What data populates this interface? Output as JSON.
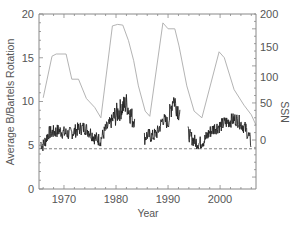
{
  "chart_data": {
    "type": "line",
    "title": "",
    "xlabel": "Year",
    "ylabel": "Average B/Bartels Rotation",
    "y2label": "SSN",
    "xlim": [
      1965.2,
      2006.9
    ],
    "ylim": [
      0,
      20
    ],
    "y2lim": [
      -50,
      200
    ],
    "x_ticks": [
      1970,
      1980,
      1990,
      2000
    ],
    "y_ticks": [
      0,
      5,
      10,
      15,
      20
    ],
    "y2_ticks": [
      0,
      50,
      100,
      150,
      200
    ],
    "grid": false,
    "legend": null,
    "reference_line": {
      "axis": "left",
      "value": 4.6,
      "style": "dashed"
    },
    "series": [
      {
        "name": "Average B per Bartels Rotation",
        "axis": "left",
        "color": "#222222",
        "style": "noisy line",
        "x": [
          1965.5,
          1966.0,
          1966.5,
          1967,
          1968,
          1969,
          1970,
          1971,
          1972,
          1973,
          1974,
          1975,
          1976,
          1977,
          1978,
          1979,
          1980,
          1981,
          1982,
          1983,
          1985.5,
          1986,
          1987,
          1988,
          1989,
          1990,
          1991,
          1992,
          1994,
          1995,
          1996,
          1997,
          1998,
          1999,
          2000,
          2001,
          2002,
          2003,
          2004,
          2005,
          2006
        ],
        "values": [
          5.3,
          5.0,
          5.6,
          6.4,
          6.5,
          6.7,
          6.4,
          6.3,
          6.6,
          6.9,
          7.0,
          6.5,
          5.8,
          5.6,
          6.8,
          7.6,
          8.5,
          9.2,
          9.8,
          8.2,
          5.8,
          6.2,
          6.0,
          6.5,
          8.0,
          7.5,
          10.5,
          9.0,
          6.2,
          5.5,
          5.2,
          5.6,
          6.5,
          7.0,
          7.2,
          7.6,
          7.8,
          8.0,
          7.5,
          6.8,
          5.2
        ]
      },
      {
        "name": "SSN",
        "axis": "right",
        "color": "#aaaaaa",
        "style": "line",
        "x": [
          1966.0,
          1967.7,
          1968.5,
          1970.4,
          1971.5,
          1972.8,
          1974.3,
          1975.9,
          1977.1,
          1979.3,
          1980.3,
          1981.3,
          1982.4,
          1983.4,
          1984.3,
          1985.6,
          1986.5,
          1989.0,
          1990.0,
          1991.3,
          1992.1,
          1993.6,
          1995.0,
          1996.5,
          1999.8,
          2000.8,
          2002.7,
          2004.6,
          2006.0,
          2006.9
        ],
        "values": [
          57,
          113,
          116,
          116,
          82,
          82,
          56,
          44,
          30,
          154,
          156,
          155,
          134,
          107,
          73,
          39,
          32,
          158,
          150,
          150,
          127,
          73,
          39,
          30,
          119,
          111,
          68,
          47,
          34,
          20
        ]
      }
    ]
  },
  "axes": {
    "left_tick_labels": [
      "0",
      "5",
      "10",
      "15",
      "20"
    ],
    "right_tick_labels": [
      "0",
      "50",
      "100",
      "150",
      "200"
    ],
    "x_tick_labels": [
      "1970",
      "1980",
      "1990",
      "2000"
    ],
    "xlabel": "Year",
    "ylabel": "Average B/Bartels Rotation",
    "y2label": "SSN"
  },
  "colors": {
    "axis": "#888888",
    "b_series": "#222222",
    "ssn_series": "#aaaaaa",
    "dashed": "#666666",
    "text": "#555555"
  }
}
